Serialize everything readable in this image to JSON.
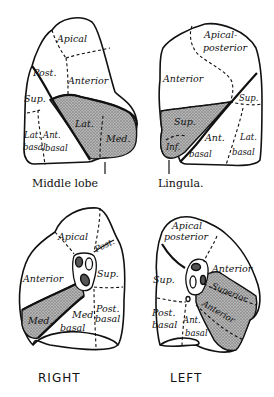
{
  "figure": {
    "colors": {
      "line": "#111111",
      "shade": "#9a9a9a",
      "background": "#ffffff"
    }
  },
  "lateral_right": {
    "segments": {
      "apical": "Apical",
      "posterior": "Post.",
      "anterior": "Anterior",
      "superior": "Sup.",
      "lateral_basal_1": "Lat.",
      "lateral_basal_2": "basal",
      "anterior_basal_1": "Ant.",
      "anterior_basal_2": "basal",
      "middle_lateral": "Lat.",
      "middle_medial": "Med."
    },
    "caption": "Middle lobe"
  },
  "lateral_left": {
    "segments": {
      "apical_posterior_1": "Apical-",
      "apical_posterior_2": "posterior",
      "anterior": "Anterior",
      "superior": "Sup.",
      "lingula_superior": "Sup.",
      "lingula_inferior": "Inf.",
      "anterior_basal_1": "Ant.",
      "anterior_basal_2": "basal",
      "lateral_basal_1": "Lat.",
      "lateral_basal_2": "basal"
    },
    "caption": "Lingula."
  },
  "medial_right": {
    "segments": {
      "apical": "Apical",
      "posterior": "Post.",
      "anterior": "Anterior",
      "superior": "Sup.",
      "posterior_basal_1": "Post.",
      "posterior_basal_2": "basal",
      "medial_basal_1": "Med.",
      "medial_basal_2": "basal",
      "middle_medial": "Med."
    },
    "side_label": "RIGHT"
  },
  "medial_left": {
    "segments": {
      "apical_posterior_1": "Apical",
      "apical_posterior_2": "posterior",
      "anterior": "Anterior",
      "superior": "Sup.",
      "posterior_basal_1": "Post.",
      "posterior_basal_2": "basal",
      "anterior_basal_1": "Ant.",
      "anterior_basal_2": "basal",
      "lingula_superior": "Superior",
      "lingula_inferior": "Anterior"
    },
    "side_label": "LEFT"
  }
}
